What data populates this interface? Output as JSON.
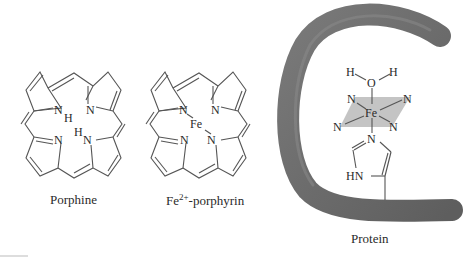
{
  "diagram": {
    "panels": [
      {
        "id": "porphine",
        "caption": "Porphine",
        "atoms": {
          "n1": "N",
          "h1": "H",
          "n2": "N",
          "n3": "N",
          "h2": "H",
          "n4": "N"
        }
      },
      {
        "id": "fe-porphyrin",
        "caption_base": "Fe",
        "caption_sup": "2+",
        "caption_rest": "-porphyrin",
        "atoms": {
          "n1": "N",
          "n2": "N",
          "fe": "Fe",
          "n3": "N",
          "n4": "N"
        }
      },
      {
        "id": "protein",
        "caption": "Protein",
        "atoms": {
          "h_left": "H",
          "o": "O",
          "h_right": "H",
          "n_tl": "N",
          "n_tr": "N",
          "fe": "Fe",
          "n_bl": "N",
          "n_br": "N",
          "n_his": "N",
          "hn_his": "HN"
        }
      }
    ],
    "colors": {
      "protein_tube": "#6b6b6b",
      "heme_plane": "#c4c4c4",
      "bond": "#555555",
      "text": "#2a2a2a"
    }
  }
}
